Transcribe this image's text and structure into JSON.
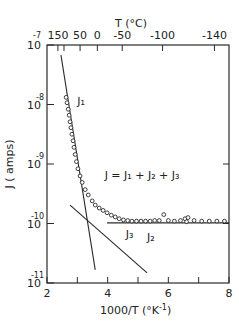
{
  "chart_data": {
    "type": "scatter",
    "title": "",
    "xlabel": "1000/T (°K⁻¹)",
    "ylabel": "J (amps)",
    "top_xlabel": "T (°C)",
    "xlim": [
      2,
      8
    ],
    "ylim_log10": [
      -11,
      -7
    ],
    "yscale": "log",
    "grid": false,
    "legend": "none",
    "x_ticks": [
      2,
      3,
      4,
      5,
      6,
      7,
      8
    ],
    "x_tick_labels": [
      "2",
      "",
      "4",
      "",
      "6",
      "",
      "8"
    ],
    "y_ticks_log10": [
      -7,
      -8,
      -9,
      -10,
      -11
    ],
    "y_tick_labels": [
      "10^-7",
      "10^-8",
      "10^-9",
      "10^-10",
      "10^-11"
    ],
    "top_ticks": [
      {
        "label": "150",
        "x": 2.36
      },
      {
        "label": "",
        "x": 2.56
      },
      {
        "label": "50",
        "x": 3.09
      },
      {
        "label": "0",
        "x": 3.66
      },
      {
        "label": "-50",
        "x": 4.48
      },
      {
        "label": "-100",
        "x": 5.81
      },
      {
        "label": "-140",
        "x": 7.52
      }
    ],
    "top_tick_display": [
      "150",
      "50",
      "0",
      "-50",
      "-100",
      "-140"
    ],
    "annotations": [
      {
        "text": "J₁",
        "x": 3.0,
        "log10y": -8.0
      },
      {
        "text": "J = J₁ + J₂ + J₃",
        "x": 3.9,
        "log10y": -9.25
      },
      {
        "text": "J₂",
        "x": 5.3,
        "log10y": -10.3
      },
      {
        "text": "J₃",
        "x": 4.6,
        "log10y": -10.25
      }
    ],
    "series": [
      {
        "name": "J (measured)",
        "type": "scatter",
        "marker": "open-circle",
        "points": [
          {
            "x": 2.63,
            "log10y": -7.88
          },
          {
            "x": 2.66,
            "log10y": -7.97
          },
          {
            "x": 2.7,
            "log10y": -8.08
          },
          {
            "x": 2.73,
            "log10y": -8.18
          },
          {
            "x": 2.76,
            "log10y": -8.29
          },
          {
            "x": 2.79,
            "log10y": -8.39
          },
          {
            "x": 2.82,
            "log10y": -8.5
          },
          {
            "x": 2.86,
            "log10y": -8.61
          },
          {
            "x": 2.89,
            "log10y": -8.72
          },
          {
            "x": 2.93,
            "log10y": -8.84
          },
          {
            "x": 2.97,
            "log10y": -8.96
          },
          {
            "x": 3.02,
            "log10y": -9.08
          },
          {
            "x": 3.09,
            "log10y": -9.2
          },
          {
            "x": 3.16,
            "log10y": -9.31
          },
          {
            "x": 3.26,
            "log10y": -9.43
          },
          {
            "x": 3.36,
            "log10y": -9.52
          },
          {
            "x": 3.49,
            "log10y": -9.62
          },
          {
            "x": 3.59,
            "log10y": -9.69
          },
          {
            "x": 3.72,
            "log10y": -9.74
          },
          {
            "x": 3.85,
            "log10y": -9.78
          },
          {
            "x": 3.98,
            "log10y": -9.82
          },
          {
            "x": 4.12,
            "log10y": -9.86
          },
          {
            "x": 4.25,
            "log10y": -9.89
          },
          {
            "x": 4.38,
            "log10y": -9.92
          },
          {
            "x": 4.52,
            "log10y": -9.94
          },
          {
            "x": 4.66,
            "log10y": -9.95
          },
          {
            "x": 4.8,
            "log10y": -9.96
          },
          {
            "x": 4.95,
            "log10y": -9.96
          },
          {
            "x": 5.1,
            "log10y": -9.96
          },
          {
            "x": 5.25,
            "log10y": -9.96
          },
          {
            "x": 5.4,
            "log10y": -9.96
          },
          {
            "x": 5.55,
            "log10y": -9.95
          },
          {
            "x": 5.7,
            "log10y": -9.95
          },
          {
            "x": 5.85,
            "log10y": -9.85
          },
          {
            "x": 6.0,
            "log10y": -9.95
          },
          {
            "x": 6.2,
            "log10y": -9.96
          },
          {
            "x": 6.4,
            "log10y": -9.95
          },
          {
            "x": 6.55,
            "log10y": -9.92
          },
          {
            "x": 6.6,
            "log10y": -9.97
          },
          {
            "x": 6.65,
            "log10y": -9.9
          },
          {
            "x": 6.85,
            "log10y": -9.95
          },
          {
            "x": 7.1,
            "log10y": -9.96
          },
          {
            "x": 7.35,
            "log10y": -9.96
          },
          {
            "x": 7.6,
            "log10y": -9.96
          },
          {
            "x": 7.85,
            "log10y": -9.96
          }
        ]
      },
      {
        "name": "J₁",
        "type": "line",
        "points": [
          {
            "x": 2.46,
            "log10y": -7.17
          },
          {
            "x": 3.59,
            "log10y": -10.78
          }
        ]
      },
      {
        "name": "J₂",
        "type": "line",
        "points": [
          {
            "x": 3.98,
            "log10y": -9.99
          },
          {
            "x": 8.0,
            "log10y": -9.99
          }
        ]
      },
      {
        "name": "J₃",
        "type": "line",
        "points": [
          {
            "x": 2.76,
            "log10y": -9.69
          },
          {
            "x": 5.3,
            "log10y": -10.83
          }
        ]
      }
    ]
  },
  "labels": {
    "top_axis_title": "T (°C)",
    "bottom_axis_title": "1000/T (°K",
    "bottom_axis_sup": "-1",
    "bottom_axis_close": ")",
    "y_axis_title": "J ( amps)",
    "top_leading_label": "-7",
    "y_base": "10",
    "y_exponents": [
      "-7",
      "-8",
      "-9",
      "-10",
      "-11"
    ]
  }
}
